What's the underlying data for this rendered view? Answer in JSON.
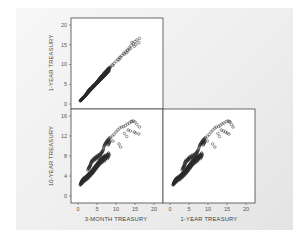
{
  "chart_data": {
    "type": "scatter",
    "layout": "scatterplot-matrix",
    "variables": [
      "3-MONTH TREASURY",
      "1-YEAR TREASURY",
      "10-YEAR TREASURY"
    ],
    "panels": [
      {
        "id": "top-left",
        "x_var": "3-MONTH TREASURY",
        "y_var": "1-YEAR TREASURY",
        "ylabel": "1-YEAR TREASURY",
        "yticks": [
          0,
          5,
          10,
          15,
          20
        ],
        "ylim": [
          0,
          20
        ],
        "xlim": [
          0,
          20
        ]
      },
      {
        "id": "bottom-left",
        "x_var": "3-MONTH TREASURY",
        "y_var": "10-YEAR TREASURY",
        "ylabel": "10-YEAR TREASURY",
        "xlabel": "3-MONTH TREASURY",
        "xticks": [
          0,
          5,
          10,
          15,
          20
        ],
        "yticks": [
          0,
          4,
          8,
          12,
          16
        ],
        "xlim": [
          0,
          20
        ],
        "ylim": [
          0,
          16
        ]
      },
      {
        "id": "bottom-right",
        "x_var": "1-YEAR TREASURY",
        "y_var": "10-YEAR TREASURY",
        "xlabel": "1-YEAR TREASURY",
        "xticks": [
          0,
          5,
          10,
          15,
          20
        ],
        "xlim": [
          0,
          20
        ],
        "ylim": [
          0,
          16
        ]
      }
    ],
    "points": [
      [
        0.8,
        1.0,
        2.6
      ],
      [
        0.9,
        1.1,
        2.8
      ],
      [
        1.0,
        1.2,
        2.7
      ],
      [
        1.1,
        1.3,
        3.0
      ],
      [
        1.2,
        1.4,
        2.9
      ],
      [
        1.3,
        1.5,
        3.2
      ],
      [
        1.5,
        1.7,
        3.1
      ],
      [
        1.6,
        1.8,
        3.4
      ],
      [
        1.8,
        2.0,
        3.3
      ],
      [
        2.0,
        2.2,
        3.6
      ],
      [
        2.1,
        2.4,
        3.5
      ],
      [
        2.3,
        2.6,
        3.8
      ],
      [
        2.5,
        2.8,
        4.0
      ],
      [
        2.6,
        2.9,
        3.7
      ],
      [
        2.8,
        3.1,
        4.2
      ],
      [
        3.0,
        3.3,
        4.4
      ],
      [
        3.1,
        3.5,
        4.1
      ],
      [
        3.3,
        3.6,
        4.6
      ],
      [
        3.5,
        3.8,
        4.8
      ],
      [
        3.6,
        4.0,
        4.5
      ],
      [
        3.8,
        4.1,
        5.0
      ],
      [
        4.0,
        4.3,
        5.3
      ],
      [
        4.1,
        4.5,
        4.9
      ],
      [
        4.3,
        4.6,
        5.5
      ],
      [
        4.5,
        4.8,
        5.8
      ],
      [
        4.6,
        5.0,
        5.4
      ],
      [
        4.8,
        5.1,
        6.0
      ],
      [
        5.0,
        5.3,
        6.3
      ],
      [
        5.1,
        5.5,
        5.9
      ],
      [
        5.3,
        5.6,
        6.5
      ],
      [
        5.5,
        5.8,
        6.8
      ],
      [
        5.6,
        6.0,
        6.4
      ],
      [
        5.8,
        6.1,
        7.0
      ],
      [
        6.0,
        6.3,
        7.2
      ],
      [
        6.1,
        6.5,
        6.8
      ],
      [
        6.3,
        6.6,
        7.3
      ],
      [
        6.5,
        6.8,
        7.5
      ],
      [
        6.6,
        7.0,
        7.1
      ],
      [
        6.8,
        7.1,
        7.6
      ],
      [
        7.0,
        7.3,
        7.8
      ],
      [
        7.2,
        7.5,
        7.4
      ],
      [
        7.5,
        7.8,
        7.9
      ],
      [
        7.8,
        8.1,
        8.2
      ],
      [
        8.0,
        8.3,
        7.9
      ],
      [
        3.5,
        4.0,
        6.8
      ],
      [
        4.0,
        4.6,
        7.2
      ],
      [
        4.5,
        5.0,
        7.5
      ],
      [
        3.2,
        3.8,
        6.0
      ],
      [
        2.8,
        3.4,
        5.6
      ],
      [
        5.0,
        5.6,
        7.8
      ],
      [
        5.5,
        6.2,
        8.0
      ],
      [
        6.0,
        6.8,
        8.4
      ],
      [
        6.5,
        7.3,
        9.0
      ],
      [
        7.0,
        7.9,
        10.2
      ],
      [
        7.5,
        8.4,
        10.8
      ],
      [
        8.0,
        8.9,
        11.2
      ],
      [
        8.5,
        9.4,
        11.6
      ],
      [
        9.0,
        9.9,
        12.0
      ],
      [
        9.5,
        10.3,
        12.3
      ],
      [
        10.0,
        10.8,
        12.8
      ],
      [
        10.5,
        11.3,
        13.2
      ],
      [
        11.0,
        11.8,
        13.6
      ],
      [
        11.5,
        12.2,
        13.8
      ],
      [
        12.0,
        12.8,
        13.9
      ],
      [
        12.5,
        13.2,
        14.1
      ],
      [
        13.0,
        13.7,
        14.4
      ],
      [
        13.5,
        14.2,
        14.6
      ],
      [
        14.0,
        14.8,
        14.9
      ],
      [
        14.5,
        15.3,
        15.0
      ],
      [
        15.0,
        15.8,
        14.8
      ],
      [
        15.5,
        16.2,
        14.3
      ],
      [
        16.2,
        16.6,
        13.8
      ],
      [
        15.2,
        15.0,
        12.6
      ],
      [
        14.8,
        14.6,
        12.8
      ],
      [
        13.2,
        13.5,
        13.2
      ],
      [
        12.2,
        12.6,
        12.5
      ],
      [
        11.2,
        11.8,
        9.8
      ],
      [
        10.8,
        11.2,
        10.4
      ],
      [
        9.2,
        9.8,
        11.0
      ],
      [
        8.2,
        9.0,
        10.6
      ],
      [
        13.8,
        14.0,
        13.0
      ],
      [
        12.8,
        13.0,
        11.9
      ],
      [
        16.0,
        15.5,
        12.4
      ],
      [
        14.2,
        15.6,
        14.9
      ]
    ]
  }
}
